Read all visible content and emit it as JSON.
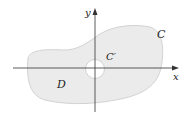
{
  "figure": {
    "labels": {
      "x_axis": "x",
      "y_axis": "y",
      "outer_curve": "C",
      "inner_curve": "C′",
      "region": "D"
    },
    "colors": {
      "region_fill": "#ebebeb",
      "region_stroke": "#d2d2d2",
      "axis": "#333333",
      "hole_fill": "#ffffff",
      "text": "#222222"
    }
  }
}
